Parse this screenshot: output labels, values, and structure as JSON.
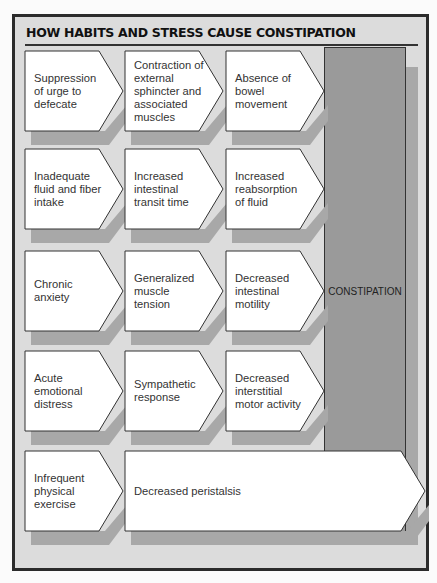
{
  "title": "HOW HABITS AND STRESS CAUSE CONSTIPATION",
  "result": "CONSTIPATION",
  "colors": {
    "frame": "#2b2b2b",
    "background": "#dcdcdc",
    "box": "#ffffff",
    "shadow": "#a8a8a8",
    "result": "#9a9a9a"
  },
  "rows": [
    {
      "cells": [
        "Suppression of urge to defecate",
        "Contraction of external sphincter and associated muscles",
        "Absence of bowel movement"
      ]
    },
    {
      "cells": [
        "Inadequate fluid and fiber intake",
        "Increased intestinal transit time",
        "Increased reabsorption of fluid"
      ]
    },
    {
      "cells": [
        "Chronic anxiety",
        "Generalized muscle tension",
        "Decreased intestinal motility"
      ]
    },
    {
      "cells": [
        "Acute emotional distress",
        "Sympathetic response",
        "Decreased interstitial motor activity"
      ]
    },
    {
      "cells": [
        "Infrequent physical exercise",
        "Decreased peristalsis"
      ]
    }
  ]
}
